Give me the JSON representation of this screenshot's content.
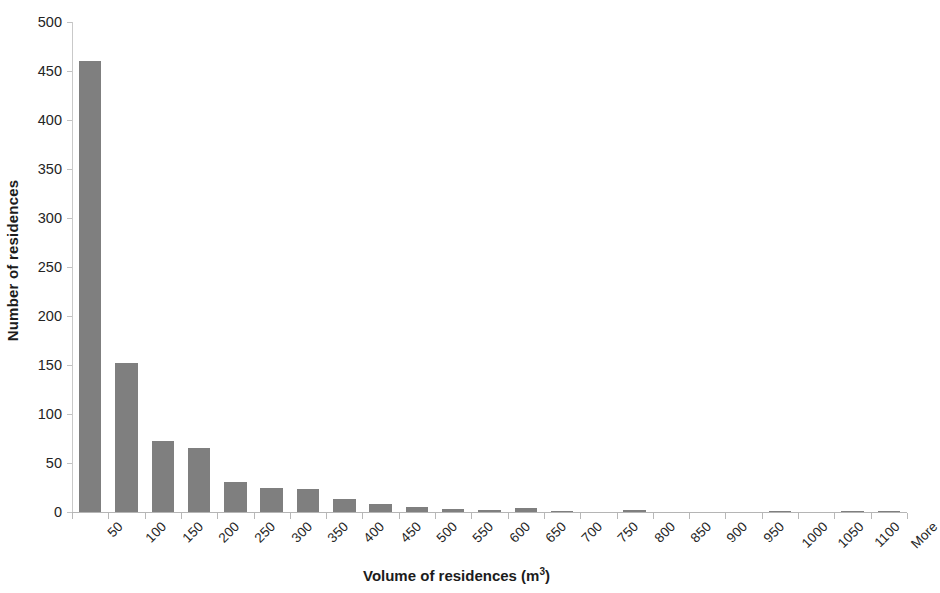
{
  "chart_data": {
    "type": "bar",
    "title": "",
    "subtitle": "",
    "xlabel": "Volume of residences (m³)",
    "xlabel_base": "Volume of residences (m",
    "xlabel_sup": "3",
    "xlabel_tail": ")",
    "ylabel": "Number of residences",
    "ylim": [
      0,
      500
    ],
    "ytick_step": 50,
    "yticks": [
      0,
      50,
      100,
      150,
      200,
      250,
      300,
      350,
      400,
      450,
      500
    ],
    "ytick_labels": [
      "0",
      "50",
      "100",
      "150",
      "200",
      "250",
      "300",
      "350",
      "400",
      "450",
      "500"
    ],
    "grid": false,
    "legend": "none",
    "bar_color": "#7f7f7f",
    "axis_color": "#bfbfbf",
    "categories": [
      "50",
      "100",
      "150",
      "200",
      "250",
      "300",
      "350",
      "400",
      "450",
      "500",
      "550",
      "600",
      "650",
      "700",
      "750",
      "800",
      "850",
      "900",
      "950",
      "1000",
      "1050",
      "1100",
      "More"
    ],
    "values": [
      460,
      152,
      72,
      65,
      31,
      24,
      23,
      13,
      8,
      5,
      3,
      2,
      4,
      1,
      0,
      2,
      0,
      0,
      0,
      1,
      0,
      1,
      1
    ],
    "series": [
      {
        "name": "Number of residences",
        "values": [
          460,
          152,
          72,
          65,
          31,
          24,
          23,
          13,
          8,
          5,
          3,
          2,
          4,
          1,
          0,
          2,
          0,
          0,
          0,
          1,
          0,
          1,
          1
        ]
      }
    ]
  }
}
